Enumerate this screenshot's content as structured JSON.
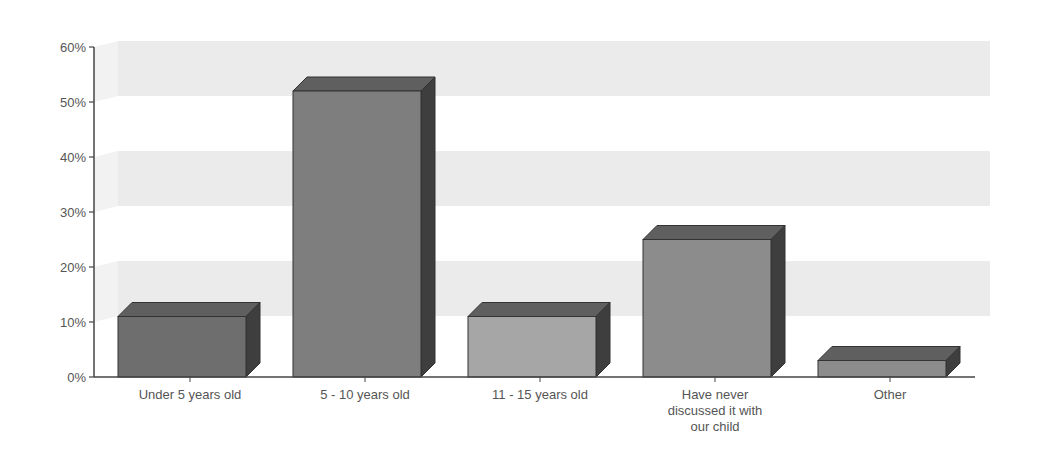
{
  "chart_data": {
    "type": "bar",
    "title": "",
    "xlabel": "",
    "ylabel": "",
    "ylim": [
      0,
      60
    ],
    "y_ticks": [
      "0%",
      "10%",
      "20%",
      "30%",
      "40%",
      "50%",
      "60%"
    ],
    "grid": "alternating horizontal bands (10-20%, 30-40%, 50-60%)",
    "legend": "none",
    "style": "3d",
    "categories": [
      "Under 5 years old",
      "5 - 10 years old",
      "11 - 15 years old",
      "Have never discussed it with our child",
      "Other"
    ],
    "category_label_lines": [
      [
        "Under 5 years old"
      ],
      [
        "5 - 10 years old"
      ],
      [
        "11 - 15 years old"
      ],
      [
        "Have never",
        "discussed it with",
        "our child"
      ],
      [
        "Other"
      ]
    ],
    "values": [
      11,
      52,
      11,
      25,
      3
    ],
    "colors": [
      "#6e6e6e",
      "#7e7e7e",
      "#a6a6a6",
      "#8c8c8c",
      "#8c8c8c"
    ],
    "band_color": "#ebebeb",
    "axis_color": "#444444"
  }
}
